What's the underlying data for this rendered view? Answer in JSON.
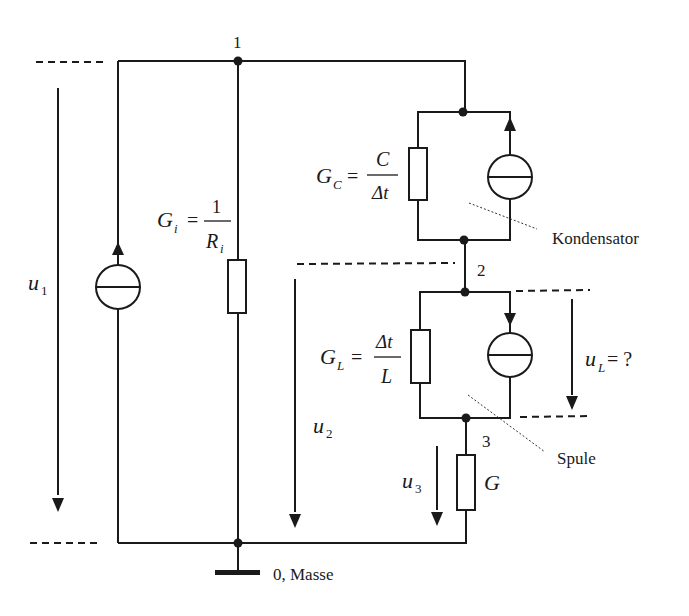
{
  "nodes": {
    "n1": "1",
    "n2": "2",
    "n3": "3",
    "ground": "0, Masse"
  },
  "components": {
    "gi": {
      "lhs": "G",
      "sub": "i",
      "eq": "=",
      "num": "1",
      "den": "R",
      "den_sub": "i"
    },
    "gc": {
      "lhs": "G",
      "sub": "C",
      "eq": "=",
      "num": "C",
      "den": "Δt"
    },
    "gl": {
      "lhs": "G",
      "sub": "L",
      "eq": "=",
      "num": "Δt",
      "den": "L"
    },
    "g": {
      "label": "G"
    }
  },
  "voltages": {
    "u1": {
      "sym": "u",
      "sub": "1"
    },
    "u2": {
      "sym": "u",
      "sub": "2"
    },
    "u3": {
      "sym": "u",
      "sub": "3"
    },
    "ul": {
      "sym": "u",
      "sub": "L",
      "suffix": " = ?"
    }
  },
  "annotations": {
    "capacitor": "Kondensator",
    "inductor": "Spule"
  },
  "colors": {
    "line": "#1a1a1a",
    "background": "#ffffff"
  }
}
